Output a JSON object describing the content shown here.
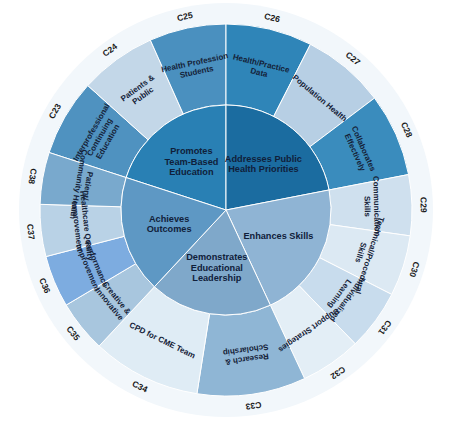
{
  "chart_data": {
    "type": "pie",
    "title": "",
    "subtitle": "",
    "xlabel": "",
    "ylabel": "",
    "layout": {
      "shape": "sunburst",
      "rings": 2,
      "legend": "none",
      "grid": false,
      "center_x": 226,
      "center_y": 210,
      "inner_radius": 105,
      "outer_radius": 186,
      "code_band_radius": 205,
      "start_angle_deg": -90,
      "rotation": "clockwise"
    },
    "inner_ring": {
      "name": "Core Domains",
      "segments": [
        {
          "label": "Promotes Team-Based Education",
          "lines": [
            "Promotes",
            "Team-Based",
            "Education"
          ],
          "value": 72,
          "color": "#2980b4",
          "start_deg": -72,
          "end_deg": 0
        },
        {
          "label": "Addresses Public Health Priorities",
          "lines": [
            "Addresses Public",
            "Health Priorities"
          ],
          "value": 79,
          "color": "#1b6ca0",
          "start_deg": 0,
          "end_deg": 79
        },
        {
          "label": "Enhances Skills",
          "lines": [
            "Enhances Skills"
          ],
          "value": 76,
          "color": "#8fb4d4",
          "start_deg": 79,
          "end_deg": 155
        },
        {
          "label": "Demonstrates Educational Leadership",
          "lines": [
            "Demonstrates",
            "Educational",
            "Leadership"
          ],
          "value": 68,
          "color": "#7fa8ca",
          "start_deg": 155,
          "end_deg": 223
        },
        {
          "label": "Achieves Outcomes",
          "lines": [
            "Achieves",
            "Outcomes"
          ],
          "value": 65,
          "color": "#5e98c4",
          "start_deg": 223,
          "end_deg": 288
        }
      ]
    },
    "outer_ring": {
      "name": "Criteria",
      "segments": [
        {
          "code": "C23",
          "label": "Interprofessional Continuing Education",
          "lines": [
            "Interprofessional",
            "Continuing",
            "Education"
          ],
          "value": 24,
          "color": "#4f92c0",
          "start_deg": -72,
          "end_deg": -48,
          "parent": "Promotes Team-Based Education"
        },
        {
          "code": "C24",
          "label": "Patients & Public",
          "lines": [
            "Patients &",
            "Public"
          ],
          "value": 24,
          "color": "#c3d7e8",
          "start_deg": -48,
          "end_deg": -24,
          "parent": "Promotes Team-Based Education"
        },
        {
          "code": "C25",
          "label": "Health Profession Students",
          "lines": [
            "Health Profession",
            "Students"
          ],
          "value": 24,
          "color": "#4a90bf",
          "start_deg": -24,
          "end_deg": 0,
          "parent": "Promotes Team-Based Education"
        },
        {
          "code": "C26",
          "label": "Health/Practice Data",
          "lines": [
            "Health/Practice",
            "Data"
          ],
          "value": 27,
          "color": "#2f85b8",
          "start_deg": 0,
          "end_deg": 27,
          "parent": "Addresses Public Health Priorities"
        },
        {
          "code": "C27",
          "label": "Population Health",
          "lines": [
            "Population Health"
          ],
          "value": 26,
          "color": "#b7cfe4",
          "start_deg": 27,
          "end_deg": 53,
          "parent": "Addresses Public Health Priorities"
        },
        {
          "code": "C28",
          "label": "Collaborates Effectively",
          "lines": [
            "Collaborates",
            "Effectively"
          ],
          "value": 26,
          "color": "#3a8cbd",
          "start_deg": 53,
          "end_deg": 79,
          "parent": "Addresses Public Health Priorities"
        },
        {
          "code": "C29",
          "label": "Communication Skills",
          "lines": [
            "Communication",
            "Skills"
          ],
          "value": 19,
          "color": "#cfe0ee",
          "start_deg": 79,
          "end_deg": 98,
          "parent": "Enhances Skills"
        },
        {
          "code": "C30",
          "label": "Technical/Procedural Skills",
          "lines": [
            "Technical/Procedural",
            "Skills"
          ],
          "value": 19,
          "color": "#dce9f3",
          "start_deg": 98,
          "end_deg": 117,
          "parent": "Enhances Skills"
        },
        {
          "code": "C31",
          "label": "Individualized Learning",
          "lines": [
            "Individualized",
            "Learning"
          ],
          "value": 19,
          "color": "#c8dced",
          "start_deg": 117,
          "end_deg": 136,
          "parent": "Enhances Skills"
        },
        {
          "code": "C32",
          "label": "Support Strategies",
          "lines": [
            "Support Strategies"
          ],
          "value": 19,
          "color": "#e3eef6",
          "start_deg": 136,
          "end_deg": 155,
          "parent": "Enhances Skills"
        },
        {
          "code": "C33",
          "label": "Research & Scholarship",
          "lines": [
            "Research &",
            "Scholarship"
          ],
          "value": 34,
          "color": "#8fb6d5",
          "start_deg": 155,
          "end_deg": 189,
          "parent": "Demonstrates Educational Leadership"
        },
        {
          "code": "C34",
          "label": "CPD for CME Team",
          "lines": [
            "CPD for CME Team"
          ],
          "value": 34,
          "color": "#dfecf5",
          "start_deg": 189,
          "end_deg": 223,
          "parent": "Demonstrates Educational Leadership"
        },
        {
          "code": "C35",
          "label": "Creative & Innovative",
          "lines": [
            "Creative &",
            "Innovative"
          ],
          "value": 22,
          "color": "#a8c6de",
          "start_deg": 223,
          "end_deg": 245,
          "parent": "Achieves Outcomes"
        },
        {
          "code": "C36",
          "label": "Performance Improvement",
          "lines": [
            "Performance",
            "Improvement"
          ],
          "value": 22,
          "color": "#7dace0",
          "start_deg": 245,
          "end_deg": 267,
          "parent": "Achieves Outcomes"
        },
        {
          "code": "C37",
          "label": "Healthcare Quality Improvement",
          "lines": [
            "Healthcare Quality",
            "Improvement"
          ],
          "value": 21,
          "color": "#b9d2e6",
          "start_deg": 267,
          "end_deg": 288,
          "parent": "Achieves Outcomes"
        },
        {
          "code": "C38",
          "label": "Patient/Community Health",
          "lines": [
            "Patient/",
            "Community Health"
          ],
          "value": 0,
          "color": "#79a9cd",
          "start_deg": 288,
          "end_deg": 288,
          "parent": "Achieves Outcomes"
        }
      ]
    },
    "colors": {
      "background": "#ffffff",
      "darkest_blue": "#1b6ca0",
      "dark_blue": "#2980b4",
      "mid_blue": "#5e98c4",
      "light_blue": "#8fb4d4",
      "pale_blue": "#dfecf5",
      "text_dark": "#10203a"
    }
  }
}
